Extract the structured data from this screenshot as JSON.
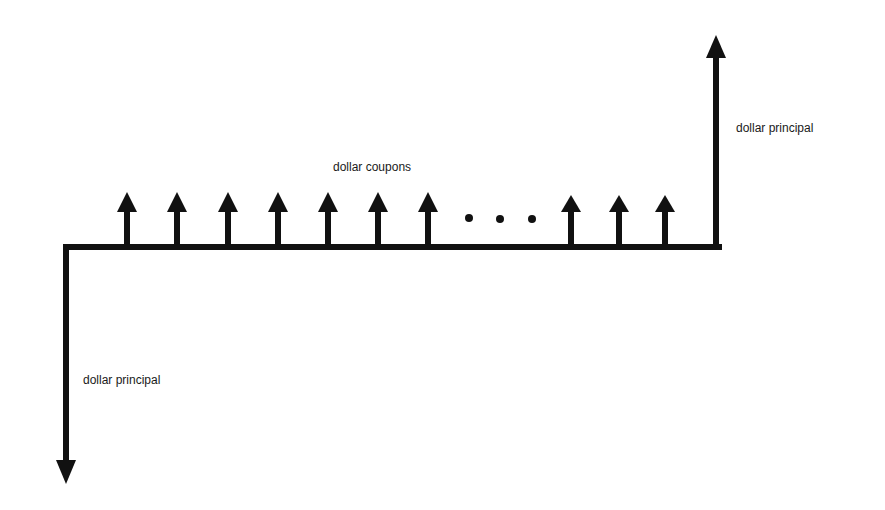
{
  "diagram": {
    "labels": {
      "coupons": "dollar coupons",
      "principal_out": "dollar principal",
      "principal_in": "dollar principal"
    },
    "coupon_arrows_before_ellipsis": 7,
    "ellipsis": "...",
    "coupon_arrows_after_ellipsis": 3,
    "colors": {
      "ink": "#111111",
      "background": "#ffffff"
    }
  }
}
